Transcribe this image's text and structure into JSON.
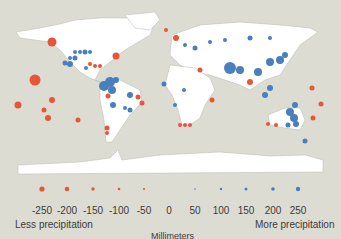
{
  "map": {
    "title": "",
    "background_color": "#dddcd2",
    "land_color": "#ffffff",
    "less_color": "#e8553a",
    "more_color": "#4a7fbd"
  },
  "legend": {
    "ticks": [
      "-250",
      "-200",
      "-150",
      "-100",
      "-50",
      "0",
      "50",
      "100",
      "150",
      "200",
      "250"
    ],
    "less_label": "Less precipitation",
    "more_label": "More precipitation",
    "unit_label": "Millimeters"
  }
}
